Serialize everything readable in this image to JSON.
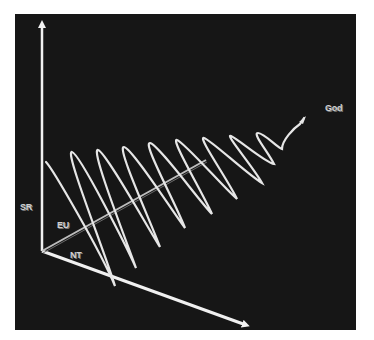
{
  "figure": {
    "background": "#161616",
    "line_color": "#e8e8e8",
    "labels": {
      "vertical_axis": "SR",
      "depth_axis": "EU",
      "horizontal_axis": "NT",
      "endpoint": "God"
    }
  }
}
